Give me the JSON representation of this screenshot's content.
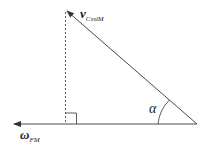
{
  "diagram": {
    "labels": {
      "v_main": "v",
      "v_sub": "CsstM",
      "omega_main": "ω",
      "omega_sub": "FM",
      "angle": "α"
    },
    "colors": {
      "line": "#333333",
      "background": "#ffffff"
    },
    "geometry": {
      "vertex": [
        197,
        124
      ],
      "horizontal_end": [
        13,
        124
      ],
      "hypotenuse_end": [
        66,
        10
      ],
      "dashed_foot": [
        66,
        124
      ],
      "right_angle_size": 11
    }
  }
}
